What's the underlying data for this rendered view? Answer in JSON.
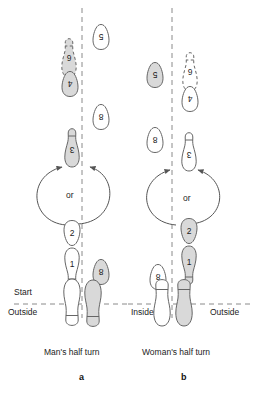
{
  "figure": {
    "title_a": "Man's half turn",
    "title_b": "Woman's half turn",
    "letter_a": "a",
    "letter_b": "b",
    "or_a": "or",
    "or_b": "or"
  },
  "axis_labels": {
    "start": "Start",
    "outside_left": "Outside",
    "inside": "Inside",
    "outside_right": "Outside"
  },
  "colors": {
    "shaded_fill": "#d9d9d9",
    "white_fill": "#ffffff",
    "stroke": "#555555",
    "dash_line": "#8a8a8a",
    "text": "#1c1c1c"
  },
  "panel_a": {
    "name": "Man's half turn",
    "steps": [
      {
        "num": "1",
        "fill": "white",
        "style": "solid",
        "side": "left-of-line",
        "rotation": 0
      },
      {
        "num": "2",
        "fill": "white",
        "style": "solid",
        "side": "left-of-line",
        "rotation": 0
      },
      {
        "num": "3",
        "fill": "shaded",
        "style": "solid",
        "side": "left-of-line",
        "rotation": 180
      },
      {
        "num": "4",
        "fill": "shaded",
        "style": "solid",
        "side": "left-of-line",
        "rotation": 180
      },
      {
        "num": "5",
        "fill": "white",
        "style": "solid",
        "side": "right-of-line",
        "rotation": 180
      },
      {
        "num": "6",
        "fill": "shaded",
        "style": "dashed",
        "side": "left-of-line",
        "rotation": 180
      },
      {
        "num": "8",
        "fill": "white",
        "style": "solid",
        "side": "right-of-line",
        "rotation": 180
      },
      {
        "num": "8",
        "fill": "shaded",
        "style": "solid",
        "side": "right-of-line",
        "rotation": 180
      }
    ],
    "start_feet": [
      {
        "fill": "white",
        "side": "left"
      },
      {
        "fill": "shaded",
        "side": "right"
      }
    ]
  },
  "panel_b": {
    "name": "Woman's half turn",
    "steps": [
      {
        "num": "1",
        "fill": "shaded",
        "style": "solid",
        "side": "right-of-line",
        "rotation": 0
      },
      {
        "num": "2",
        "fill": "shaded",
        "style": "solid",
        "side": "right-of-line",
        "rotation": 0
      },
      {
        "num": "3",
        "fill": "white",
        "style": "solid",
        "side": "right-of-line",
        "rotation": 180
      },
      {
        "num": "4",
        "fill": "white",
        "style": "solid",
        "side": "right-of-line",
        "rotation": 180
      },
      {
        "num": "5",
        "fill": "shaded",
        "style": "solid",
        "side": "left-of-line",
        "rotation": 180
      },
      {
        "num": "6",
        "fill": "white",
        "style": "dashed",
        "side": "right-of-line",
        "rotation": 180
      },
      {
        "num": "8",
        "fill": "white",
        "style": "solid",
        "side": "left-of-line",
        "rotation": 180
      }
    ],
    "start_feet": [
      {
        "fill": "white",
        "side": "left"
      },
      {
        "fill": "shaded",
        "side": "right"
      }
    ]
  }
}
